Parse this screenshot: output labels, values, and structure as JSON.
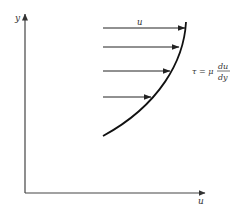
{
  "diagram": {
    "type": "velocity-profile",
    "axes": {
      "y_label": "y",
      "x_label": "u"
    },
    "profile_label": "u",
    "formula": {
      "lhs": "τ = μ",
      "numerator": "du",
      "denominator": "dy"
    },
    "arrows": [
      {
        "y": 28,
        "x_start": 103,
        "x_end": 185
      },
      {
        "y": 47,
        "x_start": 103,
        "x_end": 179
      },
      {
        "y": 71,
        "x_start": 103,
        "x_end": 170
      },
      {
        "y": 97,
        "x_start": 103,
        "x_end": 151
      }
    ],
    "colors": {
      "line": "#222222",
      "axis": "#444444",
      "text": "#333333"
    }
  }
}
